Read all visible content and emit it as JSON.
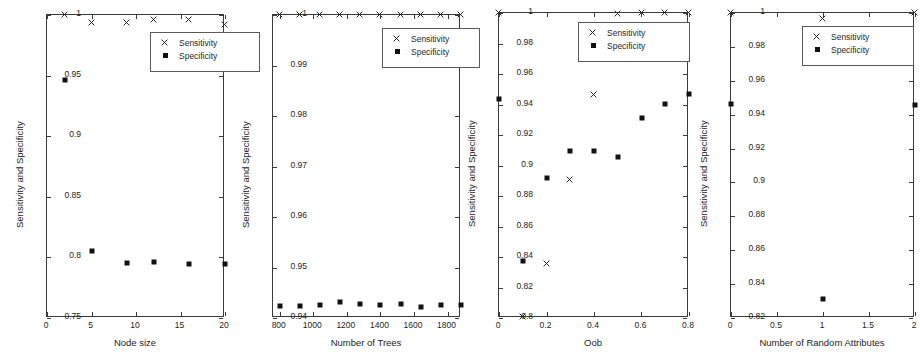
{
  "figure": {
    "panel_count": 4,
    "series_names": [
      "Sensitivity",
      "Specificity"
    ],
    "marker_sensitivity": "x-marker-icon",
    "marker_specificity": "square-marker-icon",
    "series_color": "#111111",
    "axis_color": "#3a3a3a"
  },
  "legend": {
    "sensitivity_label": "Sensitivity",
    "specificity_label": "Specificity"
  },
  "chart_data": [
    {
      "type": "scatter",
      "title": "",
      "xlabel": "Node size",
      "ylabel": "Sensitivity and Specificity",
      "xlim": [
        0,
        20
      ],
      "ylim": [
        0.75,
        1
      ],
      "xticks": [
        0,
        5,
        10,
        15,
        20
      ],
      "xticklabels": [
        "0",
        "5",
        "10",
        "15",
        "20"
      ],
      "yticks": [
        0.75,
        0.8,
        0.85,
        0.9,
        0.95,
        1
      ],
      "yticklabels": [
        "0.75",
        "0.8",
        "0.85",
        "0.9",
        "0.95",
        "1"
      ],
      "grid": false,
      "legend_position": "top-right",
      "series": [
        {
          "name": "Sensitivity",
          "marker": "x",
          "x": [
            2,
            5,
            9,
            12,
            16,
            20
          ],
          "values": [
            1.0,
            0.9935,
            0.9932,
            0.9955,
            0.9955,
            0.9915
          ]
        },
        {
          "name": "Specificity",
          "marker": "square",
          "x": [
            2,
            5,
            9,
            12,
            16,
            20
          ],
          "values": [
            0.9465,
            0.8055,
            0.7955,
            0.7958,
            0.7945,
            0.7945
          ]
        }
      ]
    },
    {
      "type": "scatter",
      "title": "",
      "xlabel": "Number of Trees",
      "ylabel": "Sensitivity and Specificity",
      "xlim": [
        760,
        1880
      ],
      "ylim": [
        0.94,
        1
      ],
      "xticks": [
        800,
        1000,
        1200,
        1400,
        1600,
        1800
      ],
      "xticklabels": [
        "800",
        "1000",
        "1200",
        "1400",
        "1600",
        "1800"
      ],
      "yticks": [
        0.94,
        0.95,
        0.96,
        0.97,
        0.98,
        0.99,
        1
      ],
      "yticklabels": [
        "0.94",
        "0.95",
        "0.96",
        "0.97",
        "0.98",
        "0.99",
        "1"
      ],
      "grid": false,
      "legend_position": "top-right",
      "series": [
        {
          "name": "Sensitivity",
          "marker": "x",
          "x": [
            800,
            920,
            1040,
            1160,
            1280,
            1400,
            1520,
            1640,
            1760,
            1880
          ],
          "values": [
            1.0,
            1.0,
            1.0,
            1.0,
            1.0,
            1.0,
            1.0,
            1.0,
            1.0,
            1.0
          ]
        },
        {
          "name": "Specificity",
          "marker": "square",
          "x": [
            800,
            920,
            1040,
            1160,
            1280,
            1400,
            1520,
            1640,
            1760,
            1880
          ],
          "values": [
            0.9423,
            0.9423,
            0.9426,
            0.9431,
            0.9428,
            0.9425,
            0.9428,
            0.9422,
            0.9425,
            0.9425
          ]
        }
      ]
    },
    {
      "type": "scatter",
      "title": "",
      "xlabel": "Oob",
      "ylabel": "Sensitivity and Specificity",
      "xlim": [
        0,
        0.8
      ],
      "ylim": [
        0.8,
        1
      ],
      "xticks": [
        0,
        0.2,
        0.4,
        0.6,
        0.8
      ],
      "xticklabels": [
        "0",
        "0.2",
        "0.4",
        "0.6",
        "0.8"
      ],
      "yticks": [
        0.8,
        0.82,
        0.84,
        0.86,
        0.88,
        0.9,
        0.92,
        0.94,
        0.96,
        0.98,
        1
      ],
      "yticklabels": [
        "0.8",
        "0.82",
        "0.84",
        "0.86",
        "0.88",
        "0.9",
        "0.92",
        "0.94",
        "0.96",
        "0.98",
        "1"
      ],
      "grid": false,
      "legend_position": "top-right",
      "series": [
        {
          "name": "Sensitivity",
          "marker": "x",
          "x": [
            0,
            0.1,
            0.2,
            0.3,
            0.4,
            0.5,
            0.6,
            0.7,
            0.8
          ],
          "values": [
            1.0,
            0.8005,
            0.8355,
            0.8905,
            0.9465,
            0.9993,
            1.0,
            1.0,
            1.0
          ]
        },
        {
          "name": "Specificity",
          "marker": "square",
          "x": [
            0,
            0.1,
            0.2,
            0.3,
            0.4,
            0.5,
            0.6,
            0.7,
            0.8
          ],
          "values": [
            0.9435,
            0.8375,
            0.8915,
            0.9098,
            0.9093,
            0.9055,
            0.9312,
            0.9405,
            0.9468
          ]
        }
      ]
    },
    {
      "type": "scatter",
      "title": "",
      "xlabel": "Number of Random Attributes",
      "ylabel": "Sensitivity and Specificity",
      "xlim": [
        0,
        2
      ],
      "ylim": [
        0.82,
        1
      ],
      "xticks": [
        0,
        0.5,
        1,
        1.5,
        2
      ],
      "xticklabels": [
        "0",
        "0.5",
        "1",
        "1.5",
        "2"
      ],
      "yticks": [
        0.82,
        0.84,
        0.86,
        0.88,
        0.9,
        0.92,
        0.94,
        0.96,
        0.98,
        1
      ],
      "yticklabels": [
        "0.82",
        "0.84",
        "0.86",
        "0.88",
        "0.9",
        "0.92",
        "0.94",
        "0.96",
        "0.98",
        "1"
      ],
      "grid": false,
      "legend_position": "top-right",
      "series": [
        {
          "name": "Sensitivity",
          "marker": "x",
          "x": [
            0,
            1,
            2
          ],
          "values": [
            1.0,
            0.9965,
            1.0
          ]
        },
        {
          "name": "Specificity",
          "marker": "square",
          "x": [
            0,
            1,
            2
          ],
          "values": [
            0.9462,
            0.8315,
            0.9455
          ]
        }
      ]
    }
  ],
  "panel_layout": [
    {
      "left": 46,
      "top": 14,
      "width": 178,
      "height": 303,
      "legend": {
        "left": 104,
        "top": 18,
        "width": 110,
        "height": 40,
        "clip": 0
      }
    },
    {
      "left": 272,
      "top": 14,
      "width": 188,
      "height": 303,
      "legend": {
        "left": 110,
        "top": 14,
        "width": 110,
        "height": 40,
        "clip": 12
      }
    },
    {
      "left": 498,
      "top": 12,
      "width": 190,
      "height": 305,
      "legend": {
        "left": 80,
        "top": 10,
        "width": 112,
        "height": 40,
        "clip": 0
      }
    },
    {
      "left": 730,
      "top": 12,
      "width": 184,
      "height": 305,
      "legend": {
        "left": 72,
        "top": 14,
        "width": 112,
        "height": 40,
        "clip": 0
      }
    }
  ]
}
